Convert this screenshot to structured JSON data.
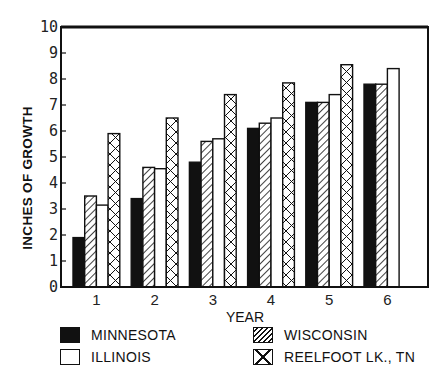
{
  "chart_data": {
    "type": "bar",
    "title": "",
    "xlabel": "YEAR",
    "ylabel": "INCHES OF GROWTH",
    "ylim": [
      0,
      10
    ],
    "yticks": [
      "0",
      "1",
      "2",
      "3",
      "4",
      "5",
      "6",
      "7",
      "8",
      "9",
      "10"
    ],
    "categories": [
      "1",
      "2",
      "3",
      "4",
      "5",
      "6"
    ],
    "grid": false,
    "legend_position": "bottom",
    "series": [
      {
        "name": "MINNESOTA",
        "pattern": "solid-black",
        "values": [
          1.9,
          3.4,
          4.8,
          6.1,
          7.1,
          7.8
        ]
      },
      {
        "name": "WISCONSIN",
        "pattern": "diagonal-hatch",
        "values": [
          3.5,
          4.6,
          5.6,
          6.3,
          7.1,
          7.8
        ]
      },
      {
        "name": "ILLINOIS",
        "pattern": "white",
        "values": [
          3.15,
          4.55,
          5.7,
          6.5,
          7.4,
          8.4
        ]
      },
      {
        "name": "REELFOOT LK., TN",
        "pattern": "cross-hatch",
        "values": [
          5.9,
          6.5,
          7.4,
          7.85,
          8.55,
          null
        ]
      }
    ]
  },
  "legend": {
    "items": [
      {
        "label": "MINNESOTA",
        "pattern": "solid-black"
      },
      {
        "label": "WISCONSIN",
        "pattern": "diagonal-hatch"
      },
      {
        "label": "ILLINOIS",
        "pattern": "white"
      },
      {
        "label": "REELFOOT LK., TN",
        "pattern": "cross-hatch"
      }
    ]
  },
  "colors": {
    "ink": "#111111",
    "background": "#ffffff"
  }
}
